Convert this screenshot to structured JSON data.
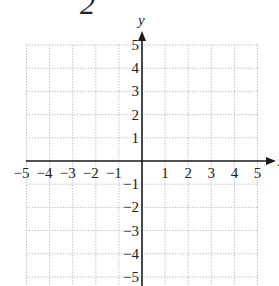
{
  "figure": {
    "problem_number_fragment": "2",
    "x_axis_label": "x",
    "y_axis_label": "y",
    "x_ticks": [
      "-5",
      "-4",
      "-3",
      "-2",
      "-1",
      "1",
      "2",
      "3",
      "4",
      "5"
    ],
    "y_ticks": [
      "5",
      "4",
      "3",
      "2",
      "1",
      "-1",
      "-2",
      "-3",
      "-4",
      "-5"
    ],
    "grid": {
      "x_min": -5,
      "x_max": 5,
      "y_min": -5,
      "y_max": 5,
      "step": 1,
      "style": "dotted"
    },
    "colors": {
      "axis": "#1a1a1a",
      "grid": "#b8b8b8",
      "text": "#222222"
    }
  }
}
